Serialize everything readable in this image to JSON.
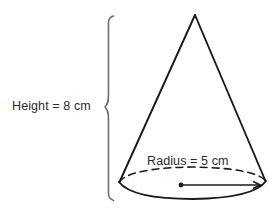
{
  "figure": {
    "shape": "cone",
    "background_color": "#ffffff",
    "stroke_color": "#1a1a1a",
    "text_color": "#2b2b2b"
  },
  "labels": {
    "height": "Height = 8 cm",
    "radius": "Radius = 5 cm"
  },
  "measurements": {
    "height_value": "8",
    "height_unit": "cm",
    "radius_value": "5",
    "radius_unit": "cm"
  },
  "geometry": {
    "apex": {
      "x": 195,
      "y": 15
    },
    "base_center": {
      "x": 192,
      "y": 183
    },
    "base_rx": 73,
    "base_ry": 16,
    "base_left": {
      "x": 119,
      "y": 182
    },
    "base_right": {
      "x": 266,
      "y": 181
    },
    "brace": {
      "x": 106,
      "y_top": 15,
      "y_bottom": 201,
      "tip_y": 107
    },
    "radius_arrow": {
      "from_x": 181,
      "from_y": 185,
      "to_x": 260,
      "to_y": 185
    }
  }
}
